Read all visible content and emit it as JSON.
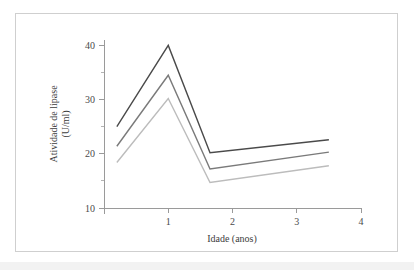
{
  "figure": {
    "background": "#ffffff",
    "border_color": "#cfcfcf"
  },
  "chart_data": {
    "type": "line",
    "title": "",
    "xlabel": "Idade (anos)",
    "ylabel": "Atividade de lipase",
    "ylabel_line2": "(U/ml)",
    "xlim": [
      0,
      4
    ],
    "ylim": [
      10,
      41
    ],
    "grid": false,
    "legend": "none",
    "x_ticks": [
      1,
      2,
      3,
      4
    ],
    "x_tick_labels": [
      "1",
      "2",
      "3",
      "4"
    ],
    "y_ticks": [
      10,
      20,
      30,
      40
    ],
    "y_tick_labels": [
      "10",
      "20",
      "30",
      "40"
    ],
    "y_minor_ticks": [
      15,
      25,
      35
    ],
    "x": [
      0.2,
      1.0,
      1.65,
      3.5
    ],
    "series": [
      {
        "name": "dark-gray-series",
        "color": "#4a4a4a",
        "values": [
          25.0,
          40.0,
          20.2,
          22.6
        ]
      },
      {
        "name": "medium-gray-series",
        "color": "#7a7a7a",
        "values": [
          21.4,
          34.5,
          17.2,
          20.3
        ]
      },
      {
        "name": "light-gray-series",
        "color": "#bcbcbc",
        "values": [
          18.4,
          30.2,
          14.7,
          17.8
        ]
      }
    ]
  }
}
